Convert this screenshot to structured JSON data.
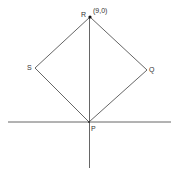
{
  "diagram": {
    "labels": {
      "R": "R",
      "R_coord": "(9,0)",
      "S": "S",
      "Q": "Q",
      "P": "P"
    },
    "points": {
      "R": [
        90,
        17
      ],
      "S": [
        35,
        68
      ],
      "Q": [
        147,
        70
      ],
      "P": [
        89,
        122
      ]
    },
    "line_color": "#444444"
  }
}
